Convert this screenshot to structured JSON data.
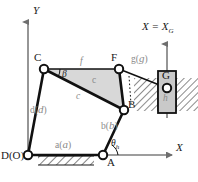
{
  "figure": {
    "type": "kinematic-linkage-diagram",
    "background": "#ffffff",
    "stroke_color": "#1a1a1a",
    "shaded_fill": "#d8d8d8",
    "gray_text": "#8a8a8a"
  },
  "axes": {
    "y_axis_label": "Y",
    "x_axis_label": "X",
    "slider_axis_label": "X = X",
    "slider_axis_sub": "G"
  },
  "joints": [
    {
      "id": "D",
      "label": "D(O)",
      "x": 28,
      "y": 155,
      "kind": "ground-pivot"
    },
    {
      "id": "A",
      "label": "A",
      "x": 103,
      "y": 155,
      "kind": "ground-pivot"
    },
    {
      "id": "B",
      "label": "B",
      "x": 124,
      "y": 110,
      "kind": "pin"
    },
    {
      "id": "C",
      "label": "C",
      "x": 44,
      "y": 69,
      "kind": "pin"
    },
    {
      "id": "F",
      "label": "F",
      "x": 119,
      "y": 69,
      "kind": "pin"
    },
    {
      "id": "G",
      "label": "G",
      "x": 167,
      "y": 88,
      "kind": "slider-pin"
    }
  ],
  "links": [
    {
      "name": "link-a",
      "label": "a(a)",
      "from": "D",
      "to": "A"
    },
    {
      "name": "link-b",
      "label": "b(b)",
      "from": "A",
      "to": "B"
    },
    {
      "name": "link-d",
      "label": "d(d)",
      "from": "D",
      "to": "C"
    },
    {
      "name": "link-f",
      "label": "f",
      "from": "C",
      "to": "F"
    },
    {
      "name": "link-c-upper",
      "label": "c",
      "from": "C",
      "to": "B"
    },
    {
      "name": "link-c-lower",
      "label": "c",
      "from": "C",
      "to": "B"
    },
    {
      "name": "link-g",
      "label": "g(g)",
      "from": "F",
      "to": "G"
    },
    {
      "name": "link-h",
      "label": "h",
      "from": "G",
      "to": "slider"
    }
  ],
  "angles": [
    {
      "name": "beta",
      "label": "β",
      "at": "C"
    },
    {
      "name": "theta-h",
      "label": "θ",
      "sub": "h",
      "at": "A"
    }
  ],
  "slider": {
    "block_label": "G",
    "guide_label": "h",
    "block_fill": "#c9c9c9"
  }
}
